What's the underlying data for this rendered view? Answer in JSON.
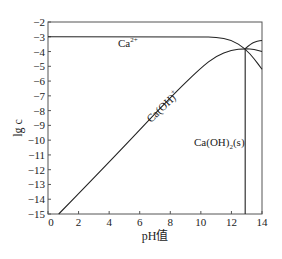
{
  "chart_data": {
    "type": "line",
    "title": "",
    "xlabel": "pH值",
    "ylabel": "lg c",
    "xlim": [
      0,
      14
    ],
    "ylim": [
      -15,
      -2
    ],
    "grid": false,
    "legend": "none (inline labels)",
    "x_ticks": [
      0,
      2,
      4,
      6,
      8,
      10,
      12,
      14
    ],
    "y_ticks": [
      -2,
      -3,
      -4,
      -5,
      -6,
      -7,
      -8,
      -9,
      -10,
      -11,
      -12,
      -13,
      -14,
      -15
    ],
    "series": [
      {
        "name": "Ca2+",
        "label": "Ca²⁺",
        "points": [
          [
            0,
            -3.0
          ],
          [
            10,
            -3.0
          ],
          [
            11,
            -3.03
          ],
          [
            12,
            -3.2
          ],
          [
            12.9,
            -3.8
          ],
          [
            13.5,
            -4.5
          ],
          [
            14,
            -5.2
          ]
        ]
      },
      {
        "name": "Ca(OH)+",
        "label": "Ca(OH)⁺",
        "points": [
          [
            0.7,
            -15.0
          ],
          [
            4,
            -11.5
          ],
          [
            8,
            -7.1
          ],
          [
            10,
            -5.1
          ],
          [
            11,
            -4.3
          ],
          [
            12,
            -3.9
          ],
          [
            12.9,
            -3.8
          ],
          [
            13.5,
            -3.85
          ],
          [
            14,
            -4.0
          ]
        ]
      },
      {
        "name": "Ca(OH)2 (aq, high pH)",
        "label": "",
        "points": [
          [
            12.9,
            -3.8
          ],
          [
            13.3,
            -3.45
          ],
          [
            13.7,
            -3.3
          ],
          [
            14,
            -3.25
          ]
        ]
      },
      {
        "name": "Ca(OH)2(s)",
        "label": "Ca(OH)₂(s)",
        "points": [
          [
            12.9,
            -3.8
          ],
          [
            12.9,
            -15.0
          ]
        ]
      }
    ],
    "annotations": [
      {
        "text": "Ca²⁺",
        "x": 4.8,
        "y": -3.7
      },
      {
        "text": "Ca(OH)⁺",
        "x": 7.3,
        "y": -9.3,
        "rotation": -45
      },
      {
        "text": "Ca(OH)₂(s)",
        "x": 10.8,
        "y": -10.2
      }
    ]
  },
  "labels": {
    "xlabel_main": "pH",
    "xlabel_suffix": "值",
    "ylabel": "lg c",
    "ca2": "Ca",
    "ca2_sup": "2+",
    "caoh": "Ca(OH)",
    "caoh_sup": "+",
    "caoh2s_a": "Ca(OH)",
    "caoh2s_sub": "2",
    "caoh2s_b": "(s)"
  },
  "style": {
    "line_color": "#222222",
    "frame_color": "#555555"
  }
}
